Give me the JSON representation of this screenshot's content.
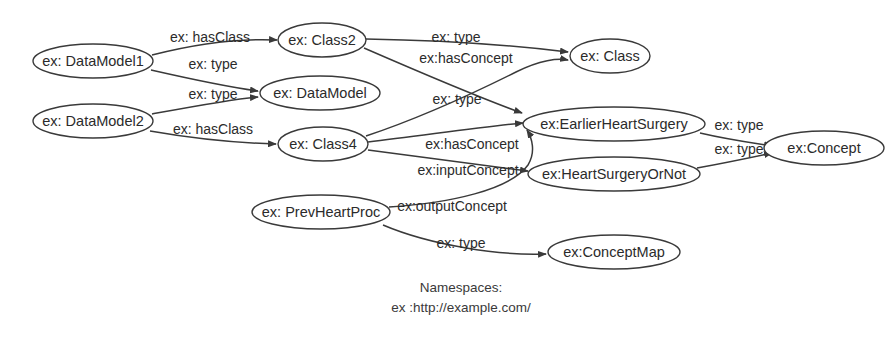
{
  "diagram": {
    "background_color": "#ffffff",
    "stroke_color": "#3a3a3a",
    "text_color": "#2b2b2b",
    "nodes": [
      {
        "id": "datamodel1",
        "label": "ex: DataModel1",
        "cx": 93,
        "cy": 61,
        "rx": 60,
        "ry": 17
      },
      {
        "id": "datamodel2",
        "label": "ex: DataModel2",
        "cx": 93,
        "cy": 121,
        "rx": 60,
        "ry": 17
      },
      {
        "id": "class2",
        "label": "ex: Class2",
        "cx": 322,
        "cy": 40,
        "rx": 44,
        "ry": 17
      },
      {
        "id": "datamodel",
        "label": "ex: DataModel",
        "cx": 320,
        "cy": 93,
        "rx": 60,
        "ry": 17
      },
      {
        "id": "class4",
        "label": "ex: Class4",
        "cx": 323,
        "cy": 144,
        "rx": 45,
        "ry": 17
      },
      {
        "id": "prevheartproc",
        "label": "ex: PrevHeartProc",
        "cx": 321,
        "cy": 212,
        "rx": 69,
        "ry": 17
      },
      {
        "id": "class",
        "label": "ex: Class",
        "cx": 610,
        "cy": 56,
        "rx": 40,
        "ry": 17
      },
      {
        "id": "earlierheartsurgery",
        "label": "ex:EarlierHeartSurgery",
        "cx": 614,
        "cy": 124,
        "rx": 91,
        "ry": 17
      },
      {
        "id": "heartsurgeryornot",
        "label": "ex:HeartSurgeryOrNot",
        "cx": 614,
        "cy": 174,
        "rx": 86,
        "ry": 17
      },
      {
        "id": "conceptmap",
        "label": "ex:ConceptMap",
        "cx": 614,
        "cy": 252,
        "rx": 66,
        "ry": 17
      },
      {
        "id": "concept",
        "label": "ex:Concept",
        "cx": 824,
        "cy": 148,
        "rx": 60,
        "ry": 17
      }
    ],
    "edges": [
      {
        "id": "e1",
        "label": "ex: hasClass",
        "from": "datamodel1",
        "to": "class2",
        "label_x": 210,
        "label_y": 38,
        "path": "M 152,55 C 195,44 235,38 277,40"
      },
      {
        "id": "e2",
        "label": "ex: type",
        "from": "datamodel1",
        "to": "datamodel",
        "label_x": 213,
        "label_y": 65,
        "path": "M 151,70 C 195,80 235,88 258,91"
      },
      {
        "id": "e3",
        "label": "ex: type",
        "from": "datamodel2",
        "to": "datamodel",
        "label_x": 213,
        "label_y": 95,
        "path": "M 152,114 C 195,106 232,99 258,97"
      },
      {
        "id": "e4",
        "label": "ex: hasClass",
        "from": "datamodel2",
        "to": "class4",
        "label_x": 213,
        "label_y": 130,
        "path": "M 150,131 C 196,139 240,143 276,144"
      },
      {
        "id": "e5",
        "label": "ex: type",
        "from": "class2",
        "to": "class",
        "label_x": 456,
        "label_y": 38,
        "path": "M 366,39 C 430,40 510,45 568,52"
      },
      {
        "id": "e6",
        "label": "ex:hasConcept",
        "from": "class2",
        "to": "earlierheartsurgery",
        "label_x": 466,
        "label_y": 59,
        "path": "M 364,48 C 410,68 480,98 522,113"
      },
      {
        "id": "e7",
        "label": "ex: type",
        "from": "class4",
        "to": "class",
        "label_x": 457,
        "label_y": 100,
        "path": "M 366,136 C 420,118 480,90 516,72 C 540,60 558,58 568,60"
      },
      {
        "id": "e8",
        "label": "ex:hasConcept",
        "from": "class4",
        "to": "earlierheartsurgery",
        "label_x": 472,
        "label_y": 145,
        "path": "M 368,142 C 420,136 480,127 523,123"
      },
      {
        "id": "e9",
        "label": "ex:inputConcept",
        "from": "class4",
        "to": "heartsurgeryornot",
        "label_x": 468,
        "label_y": 171,
        "path": "M 368,150 C 420,157 490,166 528,171"
      },
      {
        "id": "e10",
        "label": "ex:outputConcept",
        "from": "prevheartproc",
        "to": "earlierheartsurgery",
        "label_x": 452,
        "label_y": 207,
        "path": "M 389,207 C 450,203 510,190 528,165 C 536,152 532,138 527,130"
      },
      {
        "id": "e11",
        "label": "ex: type",
        "from": "prevheartproc",
        "to": "conceptmap",
        "label_x": 461,
        "label_y": 244,
        "path": "M 383,225 C 430,245 500,256 546,254"
      },
      {
        "id": "e12",
        "label": "ex: type",
        "from": "earlierheartsurgery",
        "to": "concept",
        "label_x": 739,
        "label_y": 126,
        "path": "M 700,133 C 730,140 760,144 772,146"
      },
      {
        "id": "e13",
        "label": "ex: type",
        "from": "heartsurgeryornot",
        "to": "concept",
        "label_x": 739,
        "label_y": 150,
        "path": "M 697,168 C 730,162 758,156 772,153"
      }
    ],
    "caption": {
      "line1": "Namespaces:",
      "line2": "ex :http://example.com/",
      "x": 461,
      "line1_y": 288,
      "line2_y": 308
    }
  }
}
